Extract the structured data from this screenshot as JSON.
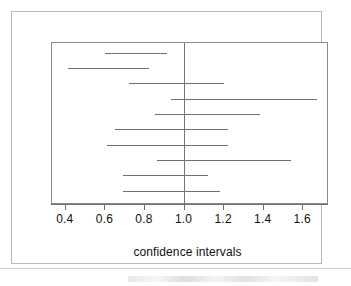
{
  "figure": {
    "x_axis_title": "confidence intervals",
    "line_color": "#6f6f6f",
    "reference_line_color": "#767676",
    "frame_color": "#b9b9b9",
    "axis_color": "#6f6f6f"
  },
  "chart_data": {
    "type": "line",
    "title": "",
    "subtitle": "",
    "xlabel": "confidence intervals",
    "ylabel": "",
    "xlim": [
      0.33,
      1.73
    ],
    "ylim": [
      0,
      11
    ],
    "grid": false,
    "legend": "none",
    "reference_line_x": 1.0,
    "xticks": [
      0.4,
      0.6,
      0.8,
      1.0,
      1.2,
      1.4,
      1.6
    ],
    "xtick_labels": [
      "0.4",
      "0.6",
      "0.8",
      "1.0",
      "1.2",
      "1.4",
      "1.6"
    ],
    "annotations": [],
    "intervals": [
      {
        "index": 1,
        "lower": 0.6,
        "upper": 0.91,
        "crosses_one": false
      },
      {
        "index": 2,
        "lower": 0.41,
        "upper": 0.82,
        "crosses_one": false
      },
      {
        "index": 3,
        "lower": 0.72,
        "upper": 1.2,
        "crosses_one": true
      },
      {
        "index": 4,
        "lower": 0.93,
        "upper": 1.67,
        "crosses_one": true
      },
      {
        "index": 5,
        "lower": 0.85,
        "upper": 1.38,
        "crosses_one": true
      },
      {
        "index": 6,
        "lower": 0.65,
        "upper": 1.22,
        "crosses_one": true
      },
      {
        "index": 7,
        "lower": 0.61,
        "upper": 1.22,
        "crosses_one": true
      },
      {
        "index": 8,
        "lower": 0.86,
        "upper": 1.54,
        "crosses_one": true
      },
      {
        "index": 9,
        "lower": 0.69,
        "upper": 1.12,
        "crosses_one": true
      },
      {
        "index": 10,
        "lower": 0.69,
        "upper": 1.18,
        "crosses_one": true
      }
    ]
  }
}
